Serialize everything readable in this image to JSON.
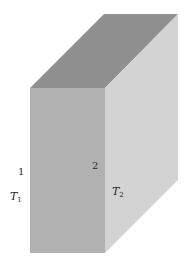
{
  "figure": {
    "type": "slab-3d",
    "colors": {
      "top_face": "#8f8f8f",
      "front_face": "#b1b1b1",
      "right_face": "#d3d3d3",
      "background": "#ffffff"
    }
  },
  "labels": {
    "face1": "1",
    "face2": "2",
    "T1": {
      "base": "T",
      "sub": "1"
    },
    "T2": {
      "base": "T",
      "sub": "2"
    }
  }
}
